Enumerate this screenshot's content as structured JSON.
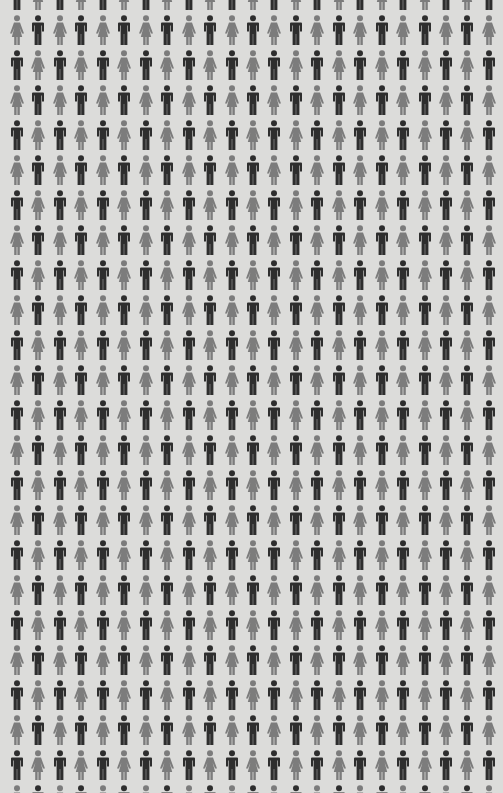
{
  "pictogram_grid": {
    "description": "Repeating grid of alternating male and female person pictograms",
    "columns": 23,
    "rows": 24,
    "first_row_offset_y": -20,
    "col_spacing": 21.45,
    "row_spacing": 35,
    "first_col_center_x": 17,
    "pattern": "checkerboard alternating male/female; partial top row starts with male",
    "colors": {
      "background": "#dcdcda",
      "male": "#2e2e2e",
      "female": "#7c7c7c"
    },
    "icons": {
      "male": "male-person-icon",
      "female": "female-person-icon"
    }
  }
}
